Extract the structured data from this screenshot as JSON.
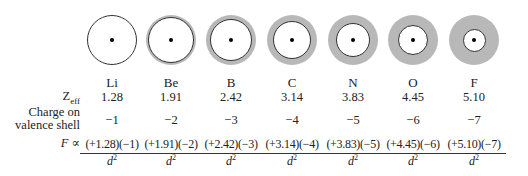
{
  "row_labels": {
    "zeff_main": "Z",
    "zeff_sub": "eff",
    "charge_line1": "Charge on",
    "charge_line2": "valence shell",
    "force": "F ∝"
  },
  "denominator": {
    "base": "d",
    "exp": "2"
  },
  "colors": {
    "shielding_gray": "#b8b8b8",
    "outline": "#333333",
    "nucleus": "#000000"
  },
  "elements": [
    {
      "symbol": "Li",
      "zeff": "1.28",
      "charge": "−1",
      "numerator": "(+1.28)(−1)",
      "center_x": 112,
      "inner_diameter": 50
    },
    {
      "symbol": "Be",
      "zeff": "1.91",
      "charge": "−2",
      "numerator": "(+1.91)(−2)",
      "center_x": 171,
      "inner_diameter": 46
    },
    {
      "symbol": "B",
      "zeff": "2.42",
      "charge": "−3",
      "numerator": "(+2.42)(−3)",
      "center_x": 231,
      "inner_diameter": 42
    },
    {
      "symbol": "C",
      "zeff": "3.14",
      "charge": "−4",
      "numerator": "(+3.14)(−4)",
      "center_x": 292,
      "inner_diameter": 38
    },
    {
      "symbol": "N",
      "zeff": "3.83",
      "charge": "−5",
      "numerator": "(+3.83)(−5)",
      "center_x": 353,
      "inner_diameter": 34
    },
    {
      "symbol": "O",
      "zeff": "4.45",
      "charge": "−6",
      "numerator": "(+4.45)(−6)",
      "center_x": 413,
      "inner_diameter": 30
    },
    {
      "symbol": "F",
      "zeff": "5.10",
      "charge": "−7",
      "numerator": "(+5.10)(−7)",
      "center_x": 474,
      "inner_diameter": 23
    }
  ]
}
